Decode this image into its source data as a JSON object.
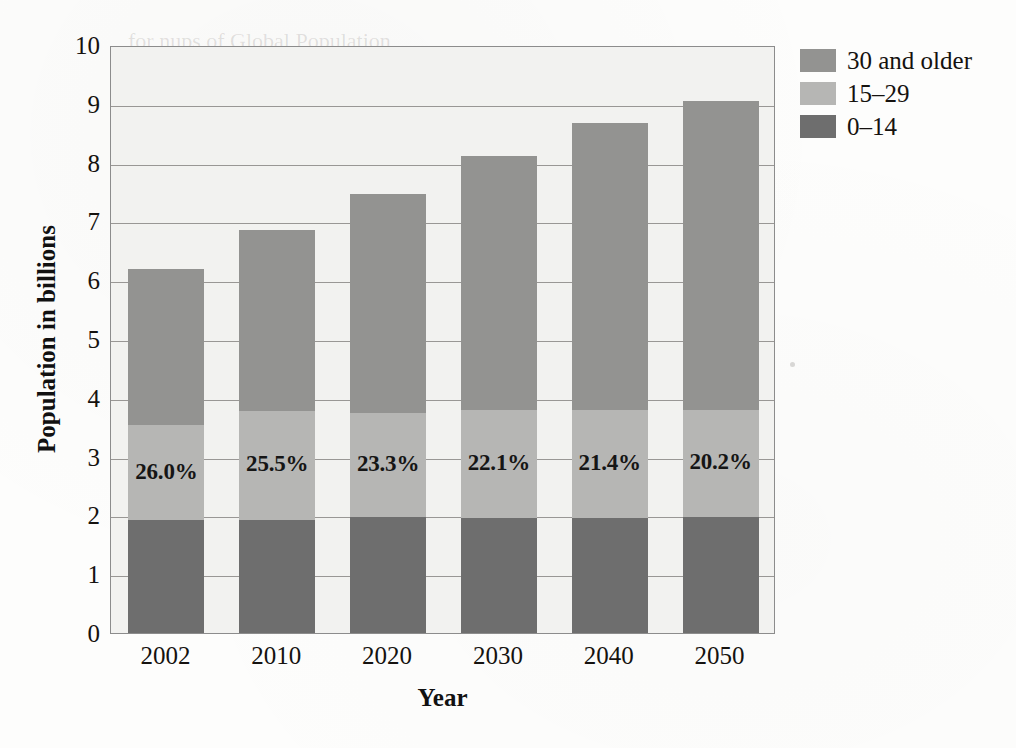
{
  "chart_data": {
    "type": "bar",
    "subtype": "stacked",
    "title": "",
    "xlabel": "Year",
    "ylabel": "Population in billions",
    "categories": [
      "2002",
      "2010",
      "2020",
      "2030",
      "2040",
      "2050"
    ],
    "ylim": [
      0,
      10
    ],
    "yticks": [
      0,
      1,
      2,
      3,
      4,
      5,
      6,
      7,
      8,
      9,
      10
    ],
    "grid": true,
    "legend_position": "right-top",
    "series": [
      {
        "name": "0–14",
        "color": "#6e6e6e",
        "values": [
          1.92,
          1.92,
          1.97,
          1.96,
          1.96,
          1.98
        ]
      },
      {
        "name": "15–29",
        "color": "#b6b6b4",
        "values": [
          1.61,
          1.86,
          1.77,
          1.83,
          1.83,
          1.82
        ]
      },
      {
        "name": "30 and older",
        "color": "#939391",
        "values": [
          2.66,
          3.07,
          3.73,
          4.33,
          4.89,
          5.25
        ]
      }
    ],
    "totals": [
      6.19,
      6.85,
      7.47,
      8.12,
      8.68,
      9.05
    ],
    "bar_labels": [
      "26.0%",
      "25.5%",
      "23.3%",
      "22.1%",
      "21.4%",
      "20.2%"
    ],
    "bar_label_note": "share of global population aged 15–29",
    "legend_entries": [
      "30 and older",
      "15–29",
      "0–14"
    ]
  },
  "axes": {
    "y_tick_labels": [
      "10",
      "9",
      "8",
      "7",
      "6",
      "5",
      "4",
      "3",
      "2",
      "1",
      "0"
    ],
    "x_tick_labels": [
      "2002",
      "2010",
      "2020",
      "2030",
      "2040",
      "2050"
    ],
    "x_title": "Year",
    "y_title": "Population in billions"
  },
  "colors": {
    "segment_0_14": "#6e6e6e",
    "segment_15_29": "#b6b6b4",
    "segment_30_older": "#939391",
    "plot_background": "#f2f2f0",
    "gridline": "#999795",
    "axis_border": "#8c8c8c",
    "text": "#15120f"
  },
  "ghost_text": {
    "line1": "for nups of Global Population",
    "line2": "Population beyond 2050",
    "line3": "by Age Group"
  }
}
